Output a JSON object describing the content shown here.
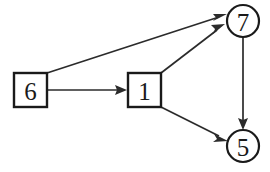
{
  "diagram": {
    "background_color": "#ffffff",
    "stroke_color": "#1a1a1a",
    "edge_color": "#2b2b2b",
    "nodes": [
      {
        "id": "n6",
        "label": "6",
        "shape": "square",
        "name": "node-6",
        "x": 30,
        "y": 90,
        "size": 34
      },
      {
        "id": "n1",
        "label": "1",
        "shape": "square",
        "name": "node-1",
        "x": 144,
        "y": 90,
        "size": 34
      },
      {
        "id": "n7",
        "label": "7",
        "shape": "circle",
        "name": "node-7",
        "x": 243,
        "y": 21,
        "size": 32
      },
      {
        "id": "n5",
        "label": "5",
        "shape": "circle",
        "name": "node-5",
        "x": 243,
        "y": 146,
        "size": 32
      }
    ],
    "edges": [
      {
        "id": "e6_1",
        "from": "6",
        "to": "1",
        "name": "edge-6-to-1",
        "directed": true
      },
      {
        "id": "e6_7",
        "from": "6",
        "to": "7",
        "name": "edge-6-to-7",
        "directed": true
      },
      {
        "id": "e1_7",
        "from": "1",
        "to": "7",
        "name": "edge-1-to-7",
        "directed": true
      },
      {
        "id": "e1_5",
        "from": "1",
        "to": "5",
        "name": "edge-1-to-5",
        "directed": true
      },
      {
        "id": "e7_5",
        "from": "7",
        "to": "5",
        "name": "edge-7-to-5",
        "directed": true
      }
    ]
  }
}
